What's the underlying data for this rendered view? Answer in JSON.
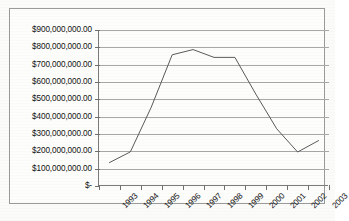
{
  "chart_data": {
    "type": "line",
    "title": "",
    "subtitle": "",
    "xlabel": "",
    "ylabel": "",
    "categories": [
      "1993",
      "1994",
      "1995",
      "1996",
      "1997",
      "1998",
      "1999",
      "2000",
      "2001",
      "2002",
      "2003"
    ],
    "values": [
      135000000,
      197000000,
      455000000,
      757000000,
      787000000,
      742000000,
      742000000,
      530000000,
      330000000,
      196000000,
      262000000
    ],
    "series": [
      {
        "name": "",
        "values": [
          135000000,
          197000000,
          455000000,
          757000000,
          787000000,
          742000000,
          742000000,
          530000000,
          330000000,
          196000000,
          262000000
        ]
      }
    ],
    "ylim": [
      0,
      900000000
    ],
    "ytick_values": [
      0,
      100000000,
      200000000,
      300000000,
      400000000,
      500000000,
      600000000,
      700000000,
      800000000,
      900000000
    ],
    "ytick_labels": [
      "$-",
      "$100,000,000.00",
      "$200,000,000.00",
      "$300,000,000.00",
      "$400,000,000.00",
      "$500,000,000.00",
      "$600,000,000.00",
      "$700,000,000.00",
      "$800,000,000.00",
      "$900,000,000.00"
    ],
    "xtick_labels": [
      "1993",
      "1994",
      "1995",
      "1996",
      "1997",
      "1998",
      "1999",
      "2000",
      "2001",
      "2002",
      "2003"
    ],
    "grid": true,
    "grid_axis": "y",
    "legend": false,
    "legend_position": "none",
    "annotations": [],
    "line_color": "#5a5a5a",
    "grid_color": "#a8a8a8",
    "axis_color": "#7b7b7b",
    "background_color": "#fdfdfc",
    "frame_color": "#9a9a9a"
  }
}
